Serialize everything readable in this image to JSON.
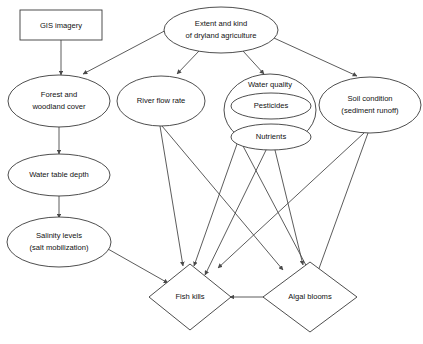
{
  "diagram": {
    "background_color": "#ffffff",
    "stroke_color": "#3a3a3a",
    "text_color": "#111111",
    "nodes": [
      {
        "id": "gis_imagery",
        "label": "GIS imagery",
        "lines": [
          "GIS imagery"
        ],
        "shape": "rectangle"
      },
      {
        "id": "extent_dryland",
        "label": "Extent and kind of dryland agriculture",
        "lines": [
          "Extent and kind",
          "of dryland agriculture"
        ],
        "shape": "ellipse"
      },
      {
        "id": "forest_cover",
        "label": "Forest and woodland cover",
        "lines": [
          "Forest and",
          "woodland cover"
        ],
        "shape": "ellipse"
      },
      {
        "id": "river_flow",
        "label": "River flow rate",
        "lines": [
          "River flow rate"
        ],
        "shape": "ellipse"
      },
      {
        "id": "water_quality",
        "label": "Water quality",
        "lines": [
          "Water quality"
        ],
        "shape": "ellipse"
      },
      {
        "id": "pesticides",
        "label": "Pesticides",
        "lines": [
          "Pesticides"
        ],
        "shape": "ellipse"
      },
      {
        "id": "nutrients",
        "label": "Nutrients",
        "lines": [
          "Nutrients"
        ],
        "shape": "ellipse"
      },
      {
        "id": "soil_condition",
        "label": "Soil condition (sediment runoff)",
        "lines": [
          "Soil condition",
          "(sediment runoff)"
        ],
        "shape": "ellipse"
      },
      {
        "id": "water_table_depth",
        "label": "Water table depth",
        "lines": [
          "Water table depth"
        ],
        "shape": "ellipse"
      },
      {
        "id": "salinity_levels",
        "label": "Salinity levels (salt mobilization)",
        "lines": [
          "Salinity levels",
          "(salt mobilization)"
        ],
        "shape": "ellipse"
      },
      {
        "id": "fish_kills",
        "label": "Fish kills",
        "lines": [
          "Fish kills"
        ],
        "shape": "diamond"
      },
      {
        "id": "algal_blooms",
        "label": "Algal blooms",
        "lines": [
          "Algal blooms"
        ],
        "shape": "diamond"
      }
    ],
    "edges": [
      {
        "from": "gis_imagery",
        "to": "forest_cover"
      },
      {
        "from": "extent_dryland",
        "to": "forest_cover"
      },
      {
        "from": "extent_dryland",
        "to": "river_flow"
      },
      {
        "from": "extent_dryland",
        "to": "water_quality"
      },
      {
        "from": "extent_dryland",
        "to": "soil_condition"
      },
      {
        "from": "forest_cover",
        "to": "water_table_depth"
      },
      {
        "from": "water_table_depth",
        "to": "salinity_levels"
      },
      {
        "from": "salinity_levels",
        "to": "fish_kills"
      },
      {
        "from": "river_flow",
        "to": "fish_kills"
      },
      {
        "from": "river_flow",
        "to": "algal_blooms"
      },
      {
        "from": "water_quality",
        "to": "fish_kills"
      },
      {
        "from": "water_quality",
        "to": "algal_blooms"
      },
      {
        "from": "nutrients",
        "to": "fish_kills"
      },
      {
        "from": "nutrients",
        "to": "algal_blooms"
      },
      {
        "from": "soil_condition",
        "to": "fish_kills"
      },
      {
        "from": "soil_condition",
        "to": "algal_blooms"
      },
      {
        "from": "algal_blooms",
        "to": "fish_kills"
      }
    ]
  }
}
